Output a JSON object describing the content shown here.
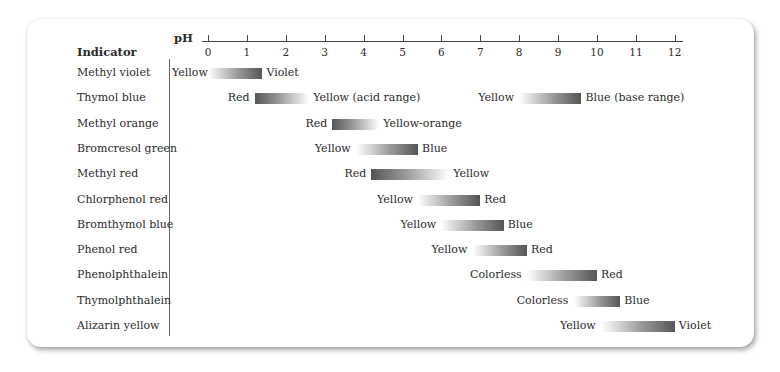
{
  "chart_data": {
    "type": "range-bar",
    "title": "",
    "header": {
      "indicator_label": "Indicator",
      "axis_label": "pH"
    },
    "xlabel": "pH",
    "xlim": [
      0,
      12
    ],
    "ticks": [
      0,
      1,
      2,
      3,
      4,
      5,
      6,
      7,
      8,
      9,
      10,
      11,
      12
    ],
    "grid": false,
    "rows": [
      {
        "indicator": "Methyl violet",
        "ranges": [
          {
            "start": 0.0,
            "end": 1.4,
            "low_color": "Yellow",
            "high_color": "Violet",
            "dark_end": "high"
          }
        ]
      },
      {
        "indicator": "Thymol blue",
        "ranges": [
          {
            "start": 1.2,
            "end": 2.6,
            "low_color": "Red",
            "high_color": "Yellow (acid range)",
            "dark_end": "low"
          },
          {
            "start": 8.0,
            "end": 9.6,
            "low_color": "Yellow",
            "high_color": "Blue (base range)",
            "dark_end": "high"
          }
        ]
      },
      {
        "indicator": "Methyl orange",
        "ranges": [
          {
            "start": 3.2,
            "end": 4.4,
            "low_color": "Red",
            "high_color": "Yellow-orange",
            "dark_end": "low"
          }
        ]
      },
      {
        "indicator": "Bromcresol green",
        "ranges": [
          {
            "start": 3.8,
            "end": 5.4,
            "low_color": "Yellow",
            "high_color": "Blue",
            "dark_end": "high"
          }
        ]
      },
      {
        "indicator": "Methyl red",
        "ranges": [
          {
            "start": 4.2,
            "end": 6.2,
            "low_color": "Red",
            "high_color": "Yellow",
            "dark_end": "low"
          }
        ]
      },
      {
        "indicator": "Chlorphenol red",
        "ranges": [
          {
            "start": 5.4,
            "end": 7.0,
            "low_color": "Yellow",
            "high_color": "Red",
            "dark_end": "high"
          }
        ]
      },
      {
        "indicator": "Bromthymol blue",
        "ranges": [
          {
            "start": 6.0,
            "end": 7.6,
            "low_color": "Yellow",
            "high_color": "Blue",
            "dark_end": "high"
          }
        ]
      },
      {
        "indicator": "Phenol red",
        "ranges": [
          {
            "start": 6.8,
            "end": 8.2,
            "low_color": "Yellow",
            "high_color": "Red",
            "dark_end": "high"
          }
        ]
      },
      {
        "indicator": "Phenolphthalein",
        "ranges": [
          {
            "start": 8.2,
            "end": 10.0,
            "low_color": "Colorless",
            "high_color": "Red",
            "dark_end": "high"
          }
        ]
      },
      {
        "indicator": "Thymolphthalein",
        "ranges": [
          {
            "start": 9.4,
            "end": 10.6,
            "low_color": "Colorless",
            "high_color": "Blue",
            "dark_end": "high"
          }
        ]
      },
      {
        "indicator": "Alizarin yellow",
        "ranges": [
          {
            "start": 10.1,
            "end": 12.0,
            "low_color": "Yellow",
            "high_color": "Violet",
            "dark_end": "high"
          }
        ]
      }
    ]
  },
  "layout": {
    "x0": 208,
    "px_per_unit": 38.9,
    "row_top": 73,
    "row_step": 25.3
  }
}
